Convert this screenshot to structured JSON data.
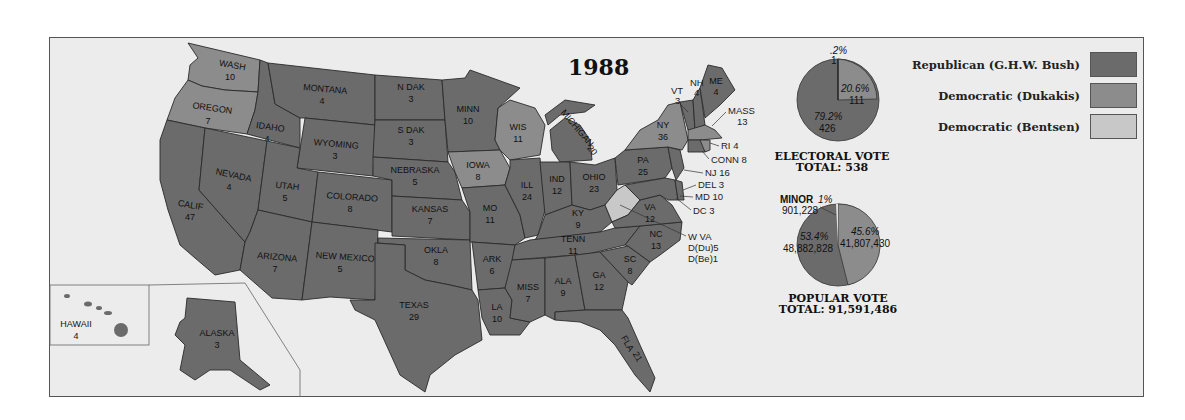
{
  "title": "1988",
  "colors": {
    "republican": "#6b6b6b",
    "democratic_dukakis": "#8c8c8c",
    "democratic_bentsen": "#c8c8c8",
    "background": "#ececec",
    "water": "#ececec"
  },
  "legend": [
    {
      "label": "Republican (G.H.W. Bush)",
      "color": "#6b6b6b"
    },
    {
      "label": "Democratic (Dukakis)",
      "color": "#8c8c8c"
    },
    {
      "label": "Democratic (Bentsen)",
      "color": "#c8c8c8"
    }
  ],
  "electoral_vote": {
    "title": "ELECTORAL VOTE",
    "total_label": "TOTAL: 538",
    "slices": [
      {
        "party": "Republican",
        "percent": "79.2%",
        "votes": "426"
      },
      {
        "party": "Democratic (Dukakis)",
        "percent": "20.6%",
        "votes": "111"
      },
      {
        "party": "Democratic (Bentsen)",
        "percent": ".2%",
        "votes": "1"
      }
    ]
  },
  "popular_vote": {
    "title": "POPULAR VOTE",
    "total_label": "TOTAL: 91,591,486",
    "slices": [
      {
        "party": "Republican",
        "percent": "53.4%",
        "votes": "48,882,828"
      },
      {
        "party": "Democratic",
        "percent": "45.6%",
        "votes": "41,807,430"
      },
      {
        "party": "Minor",
        "label": "MINOR",
        "percent": "1%",
        "votes": "901,228"
      }
    ]
  },
  "states": {
    "wash": {
      "name": "WASH",
      "ev": "10"
    },
    "oregon": {
      "name": "OREGON",
      "ev": "7"
    },
    "calif": {
      "name": "CALIF",
      "ev": "47"
    },
    "idaho": {
      "name": "IDAHO",
      "ev": "4"
    },
    "nevada": {
      "name": "NEVADA",
      "ev": "4"
    },
    "montana": {
      "name": "MONTANA",
      "ev": "4"
    },
    "wyoming": {
      "name": "WYOMING",
      "ev": "3"
    },
    "utah": {
      "name": "UTAH",
      "ev": "5"
    },
    "arizona": {
      "name": "ARIZONA",
      "ev": "7"
    },
    "colorado": {
      "name": "COLORADO",
      "ev": "8"
    },
    "newmexico": {
      "name": "NEW MEXICO",
      "ev": "5"
    },
    "ndak": {
      "name": "N DAK",
      "ev": "3"
    },
    "sdak": {
      "name": "S DAK",
      "ev": "3"
    },
    "nebraska": {
      "name": "NEBRASKA",
      "ev": "5"
    },
    "kansas": {
      "name": "KANSAS",
      "ev": "7"
    },
    "okla": {
      "name": "OKLA",
      "ev": "8"
    },
    "texas": {
      "name": "TEXAS",
      "ev": "29"
    },
    "minn": {
      "name": "MINN",
      "ev": "10"
    },
    "iowa": {
      "name": "IOWA",
      "ev": "8"
    },
    "mo": {
      "name": "MO",
      "ev": "11"
    },
    "ark": {
      "name": "ARK",
      "ev": "6"
    },
    "la": {
      "name": "LA",
      "ev": "10"
    },
    "wis": {
      "name": "WIS",
      "ev": "11"
    },
    "ill": {
      "name": "ILL",
      "ev": "24"
    },
    "michigan": {
      "name": "MICHIGAN",
      "ev": "20"
    },
    "ind": {
      "name": "IND",
      "ev": "12"
    },
    "ohio": {
      "name": "OHIO",
      "ev": "23"
    },
    "ky": {
      "name": "KY",
      "ev": "9"
    },
    "tenn": {
      "name": "TENN",
      "ev": "11"
    },
    "miss": {
      "name": "MISS",
      "ev": "7"
    },
    "ala": {
      "name": "ALA",
      "ev": "9"
    },
    "ga": {
      "name": "GA",
      "ev": "12"
    },
    "fla": {
      "name": "FLA",
      "ev": "21"
    },
    "sc": {
      "name": "SC",
      "ev": "8"
    },
    "nc": {
      "name": "NC",
      "ev": "13"
    },
    "va": {
      "name": "VA",
      "ev": "12"
    },
    "pa": {
      "name": "PA",
      "ev": "25"
    },
    "ny": {
      "name": "NY",
      "ev": "36"
    },
    "vt": {
      "name": "VT",
      "ev": "3"
    },
    "nh": {
      "name": "NH",
      "ev": "4"
    },
    "me": {
      "name": "ME",
      "ev": "4"
    },
    "hawaii": {
      "name": "HAWAII",
      "ev": "4"
    },
    "alaska": {
      "name": "ALASKA",
      "ev": "3"
    }
  },
  "callouts": {
    "mass": "MASS",
    "mass_ev": "13",
    "ri": "RI 4",
    "conn": "CONN 8",
    "nj": "NJ 16",
    "del": "DEL 3",
    "md": "MD 10",
    "dc": "DC 3",
    "wva": "W VA",
    "wva_du": "D(Du)5",
    "wva_be": "D(Be)1"
  }
}
